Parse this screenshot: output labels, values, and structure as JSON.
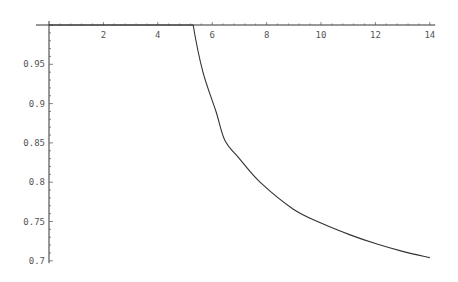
{
  "chart_data": {
    "type": "line",
    "title": "",
    "xlabel": "",
    "ylabel": "",
    "xlim": [
      0,
      14.2
    ],
    "ylim": [
      0.7,
      1.0
    ],
    "grid": false,
    "legend": null,
    "x_ticks": [
      2,
      4,
      6,
      8,
      10,
      12,
      14
    ],
    "x_tick_labels": [
      "2",
      "4",
      "6",
      "8",
      "10",
      "12",
      "14"
    ],
    "y_ticks": [
      0.7,
      0.75,
      0.8,
      0.85,
      0.9,
      0.95
    ],
    "y_tick_labels": [
      "0.7",
      "0.75",
      "0.8",
      "0.85",
      "0.9",
      "0.95"
    ],
    "series": [
      {
        "name": "curve",
        "color": "#333333",
        "x": [
          0,
          1,
          2,
          3,
          4,
          5,
          5.3,
          5.66,
          6.14,
          6.47,
          7.0,
          7.76,
          8.97,
          10.0,
          11.07,
          12.0,
          13.0,
          14.0
        ],
        "y": [
          1.0,
          1.0,
          1.0,
          1.0,
          1.0,
          1.0,
          1.0,
          0.94,
          0.89,
          0.853,
          0.83,
          0.8,
          0.766,
          0.748,
          0.733,
          0.722,
          0.712,
          0.704
        ]
      }
    ]
  },
  "plot_area": {
    "x0_px": 49,
    "px_per_x": 27.2,
    "y1_px": 25,
    "px_per_y": 786
  }
}
